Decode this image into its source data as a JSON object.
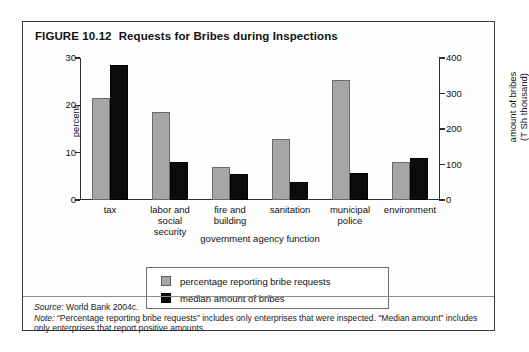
{
  "figure": {
    "number": "FIGURE 10.12",
    "title": "Requests for Bribes during Inspections"
  },
  "footer": {
    "source_label": "Source:",
    "source_text": " World Bank 2004c.",
    "note_label": "Note:",
    "note_text": " “Percentage reporting bribe requests” includes only enterprises that were inspected. “Median amount” includes only enterprises that report positive amounts."
  },
  "colors": {
    "series_gray": "#a6a6a6",
    "series_black": "#0c0c0c",
    "frame": "#3b3b3b",
    "axis": "#2e2e2e"
  },
  "chart_data": {
    "type": "bar",
    "title": "Requests for Bribes during Inspections",
    "xlabel": "government agency function",
    "ylabel": "percent",
    "y2label": "amount of bribes (T Sh thousand)",
    "ylabel_right_line1": "amount of bribes",
    "ylabel_right_line2": "(T Sh thousand)",
    "ylim": [
      0,
      30
    ],
    "y2lim": [
      0,
      400
    ],
    "yticks": [
      0,
      10,
      20,
      30
    ],
    "y2ticks": [
      0,
      100,
      200,
      300,
      400
    ],
    "grid": false,
    "legend_position": "below-plot",
    "categories": [
      "tax",
      "labor and social security",
      "fire and building",
      "sanitation",
      "municipal police",
      "environment"
    ],
    "category_lines": [
      [
        "tax"
      ],
      [
        "labor and",
        "social",
        "security"
      ],
      [
        "fire and",
        "building"
      ],
      [
        "sanitation"
      ],
      [
        "municipal",
        "police"
      ],
      [
        "environment"
      ]
    ],
    "series": [
      {
        "name": "percentage reporting bribe requests",
        "axis": "left",
        "unit": "percent",
        "color": "#a6a6a6",
        "values": [
          21.5,
          18.7,
          6.9,
          12.8,
          25.4,
          8.0
        ]
      },
      {
        "name": "median amount of bribes",
        "axis": "right",
        "unit": "T Sh thousand",
        "color": "#0c0c0c",
        "values": [
          380,
          107,
          72,
          50,
          76,
          117
        ]
      }
    ]
  }
}
